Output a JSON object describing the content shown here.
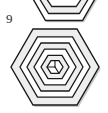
{
  "panel": {
    "index_label": "9",
    "background_color": "#ffffff",
    "width": 108,
    "height": 113
  },
  "figures": [
    {
      "name": "clipped-hexagon-above",
      "shape": "hexagon",
      "clipped": true,
      "clip_edge": "top",
      "center_x": 64,
      "center_y": -12,
      "radius": 37,
      "orientation": "flat-top",
      "stroke_color": "#1a1a1a",
      "fill_color": "#ffffff",
      "shadow_color": "#b9b9b9"
    },
    {
      "name": "concentric-hexagon-maze",
      "shape": "hexagon",
      "clipped": false,
      "center_x": 55,
      "center_y": 67,
      "radius": 44,
      "orientation": "flat-top",
      "ring_count": 5,
      "ring_radii": [
        44,
        35,
        26,
        17,
        9
      ],
      "band_fill_color": "#eeeeee",
      "gap_fill_color": "#ffffff",
      "stroke_color": "#1a1a1a",
      "stroke_width": 1.3,
      "inner_cube_lines": 3,
      "inner_cube_line_color": "#1a1a1a"
    }
  ],
  "colors": {
    "ink": "#1a1a1a",
    "paper": "#ffffff",
    "band": "#eeeeee",
    "shade": "#c9c9c9",
    "label_text": "#2b2b2b"
  }
}
